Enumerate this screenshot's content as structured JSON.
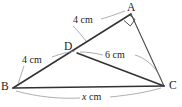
{
  "figure": {
    "type": "geometry-diagram",
    "background_color": "#ffffff",
    "line_color": "#323232",
    "leader_color": "#8d8d8d",
    "text_color": "#1c1c1c",
    "vertices": [
      {
        "id": "A",
        "label": "A",
        "x": 131,
        "y": 14,
        "label_x": 128,
        "label_y": 2
      },
      {
        "id": "B",
        "label": "B",
        "x": 13,
        "y": 88,
        "label_x": 2,
        "label_y": 81
      },
      {
        "id": "C",
        "label": "C",
        "x": 164,
        "y": 86,
        "label_x": 169,
        "label_y": 80
      },
      {
        "id": "D",
        "label": "D",
        "x": 77,
        "y": 53,
        "label_x": 65,
        "label_y": 41
      }
    ],
    "segments": [
      {
        "name": "segment-ba",
        "from": "B",
        "to": "A"
      },
      {
        "name": "segment-bc",
        "from": "B",
        "to": "C"
      },
      {
        "name": "segment-dc",
        "from": "D",
        "to": "C"
      },
      {
        "name": "segment-ac",
        "from": "A",
        "to": "C"
      }
    ],
    "right_angle": {
      "at": "A",
      "between": [
        "AD",
        "AC"
      ],
      "marker": "square"
    },
    "measure_labels": [
      {
        "name": "length-da",
        "text": "4 cm",
        "segment": "DA",
        "x": 73,
        "y": 15
      },
      {
        "name": "length-bd",
        "text": "4 cm",
        "segment": "BD",
        "x": 22,
        "y": 55
      },
      {
        "name": "length-dc",
        "text": "6 cm",
        "segment": "DC",
        "x": 105,
        "y": 50
      },
      {
        "name": "length-bc",
        "text": "x cm",
        "text_italic_part": "x",
        "text_rest": " cm",
        "segment": "BC",
        "x": 82,
        "y": 92
      }
    ]
  }
}
